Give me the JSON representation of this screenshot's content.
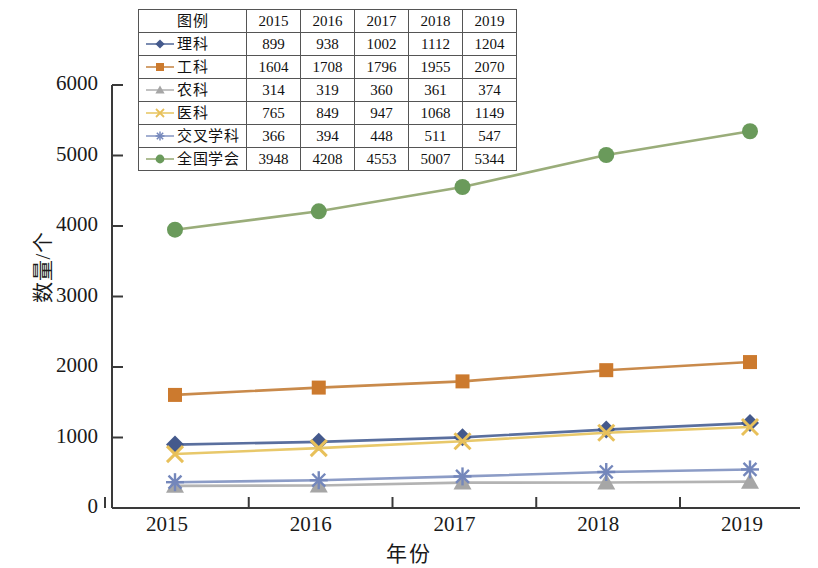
{
  "chart_data": {
    "type": "line",
    "title": "",
    "xlabel": "年份",
    "ylabel": "数量/个",
    "x": [
      2015,
      2016,
      2017,
      2018,
      2019
    ],
    "categories": [
      "2015",
      "2016",
      "2017",
      "2018",
      "2019"
    ],
    "xtick_labels": [
      "2015",
      "2016",
      "2017",
      "2018",
      "2019"
    ],
    "ytick_labels": [
      "0",
      "1000",
      "2000",
      "3000",
      "4000",
      "5000",
      "6000"
    ],
    "yticks": [
      0,
      1000,
      2000,
      3000,
      4000,
      5000,
      6000
    ],
    "ylim": [
      0,
      6000
    ],
    "grid": false,
    "legend_position": "top-inside-table",
    "series": [
      {
        "name": "理科",
        "marker": "diamond",
        "color": "#5a6f9e",
        "marker_color": "#44598c",
        "values": [
          899,
          938,
          1002,
          1112,
          1204
        ]
      },
      {
        "name": "工科",
        "marker": "square",
        "color": "#c98a4b",
        "marker_color": "#cc7a2e",
        "values": [
          1604,
          1708,
          1796,
          1955,
          2070
        ]
      },
      {
        "name": "农科",
        "marker": "triangle",
        "color": "#b3b3b3",
        "marker_color": "#a6a6a6",
        "values": [
          314,
          319,
          360,
          361,
          374
        ]
      },
      {
        "name": "医科",
        "marker": "x",
        "color": "#e8c86a",
        "marker_color": "#e8c05a",
        "values": [
          765,
          849,
          947,
          1068,
          1149
        ]
      },
      {
        "name": "交叉学科",
        "marker": "asterisk",
        "color": "#8c9cc6",
        "marker_color": "#7487bb",
        "values": [
          366,
          394,
          448,
          511,
          547
        ]
      },
      {
        "name": "全国学会",
        "marker": "circle",
        "color": "#9aad7a",
        "marker_color": "#6a9a5b",
        "values": [
          3948,
          4208,
          4553,
          5007,
          5344
        ]
      }
    ]
  },
  "legend_table": {
    "header_label": "图例",
    "year_headers": [
      "2015",
      "2016",
      "2017",
      "2018",
      "2019"
    ],
    "rows": [
      {
        "name": "理科",
        "values": [
          "899",
          "938",
          "1002",
          "1112",
          "1204"
        ]
      },
      {
        "name": "工科",
        "values": [
          "1604",
          "1708",
          "1796",
          "1955",
          "2070"
        ]
      },
      {
        "name": "农科",
        "values": [
          "314",
          "319",
          "360",
          "361",
          "374"
        ]
      },
      {
        "name": "医科",
        "values": [
          "765",
          "849",
          "947",
          "1068",
          "1149"
        ]
      },
      {
        "name": "交叉学科",
        "values": [
          "366",
          "394",
          "448",
          "511",
          "547"
        ]
      },
      {
        "name": "全国学会",
        "values": [
          "3948",
          "4208",
          "4553",
          "5007",
          "5344"
        ]
      }
    ]
  },
  "axes": {
    "y_title": "数量/个",
    "x_title": "年份"
  }
}
